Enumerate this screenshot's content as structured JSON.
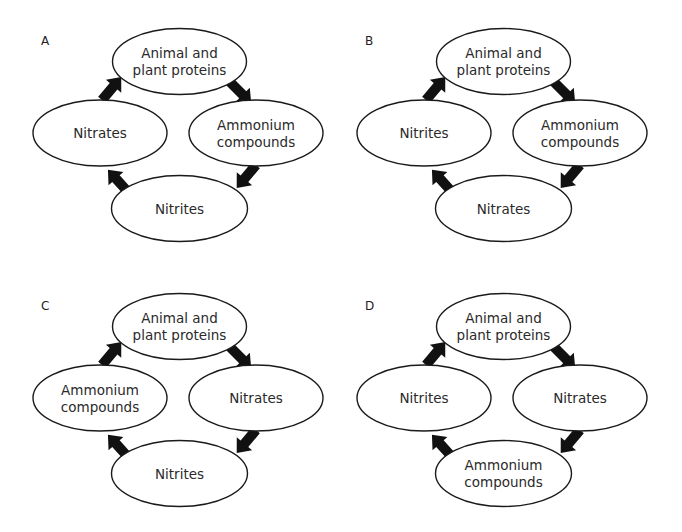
{
  "colors": {
    "background": "#ffffff",
    "stroke": "#1a1a1a",
    "arrow": "#111111",
    "text": "#2a2a2a"
  },
  "panels": [
    {
      "label": "A",
      "nodes": {
        "top": [
          "Animal and",
          "plant proteins"
        ],
        "right": [
          "Ammonium",
          "compounds"
        ],
        "bottom": [
          "Nitrites"
        ],
        "left": [
          "Nitrates"
        ]
      },
      "cycle_order": [
        "top",
        "right",
        "bottom",
        "left"
      ]
    },
    {
      "label": "B",
      "nodes": {
        "top": [
          "Animal and",
          "plant proteins"
        ],
        "right": [
          "Ammonium",
          "compounds"
        ],
        "bottom": [
          "Nitrates"
        ],
        "left": [
          "Nitrites"
        ]
      },
      "cycle_order": [
        "top",
        "right",
        "bottom",
        "left"
      ]
    },
    {
      "label": "C",
      "nodes": {
        "top": [
          "Animal and",
          "plant proteins"
        ],
        "right": [
          "Nitrates"
        ],
        "bottom": [
          "Nitrites"
        ],
        "left": [
          "Ammonium",
          "compounds"
        ]
      },
      "cycle_order": [
        "top",
        "right",
        "bottom",
        "left"
      ]
    },
    {
      "label": "D",
      "nodes": {
        "top": [
          "Animal and",
          "plant proteins"
        ],
        "right": [
          "Nitrates"
        ],
        "bottom": [
          "Ammonium",
          "compounds"
        ],
        "left": [
          "Nitrites"
        ]
      },
      "cycle_order": [
        "top",
        "right",
        "bottom",
        "left"
      ]
    }
  ]
}
